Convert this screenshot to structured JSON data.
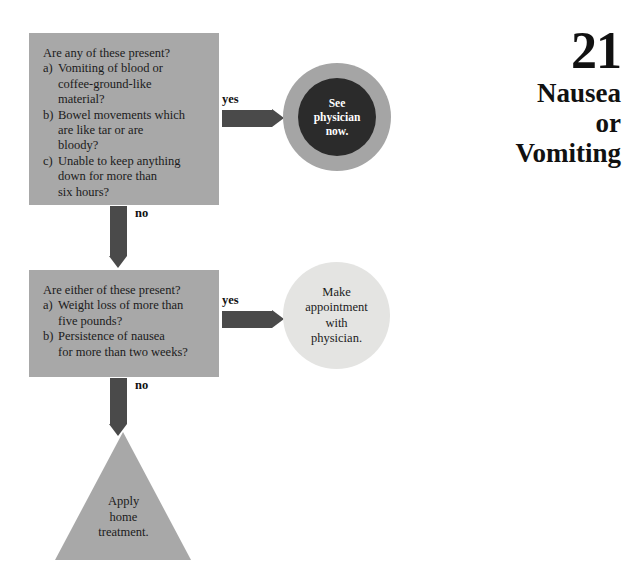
{
  "title": {
    "chapter_number": "21",
    "line1": "Nausea",
    "line2": "or",
    "line3": "Vomiting"
  },
  "colors": {
    "box_fill": "#a8a8a8",
    "arrow": "#4a4a4a",
    "urgent_ring": "#a5a5a5",
    "urgent_core": "#2b2b2b",
    "appointment_fill": "#e4e4e2",
    "triangle_fill": "#a8a8a8",
    "text": "#1b1b1b",
    "background": "#ffffff"
  },
  "flowchart": {
    "type": "decision-tree",
    "decision1": {
      "heading": "Are any of these present?",
      "items": [
        {
          "marker": "a)",
          "lines": [
            "Vomiting of blood or",
            "coffee-ground-like",
            "material?"
          ]
        },
        {
          "marker": "b)",
          "lines": [
            "Bowel movements which",
            "are like tar or are",
            "bloody?"
          ]
        },
        {
          "marker": "c)",
          "lines": [
            "Unable to keep anything",
            "down for more than",
            "six hours?"
          ]
        }
      ],
      "yes_label": "yes",
      "no_label": "no"
    },
    "decision2": {
      "heading": "Are either of these present?",
      "items": [
        {
          "marker": "a)",
          "lines": [
            "Weight loss of more than",
            "five pounds?"
          ]
        },
        {
          "marker": "b)",
          "lines": [
            "Persistence of nausea",
            "for more than two weeks?"
          ]
        }
      ],
      "yes_label": "yes",
      "no_label": "no"
    },
    "outcome_urgent": {
      "line1": "See",
      "line2": "physician",
      "line3": "now."
    },
    "outcome_appointment": {
      "line1": "Make",
      "line2": "appointment",
      "line3": "with",
      "line4": "physician."
    },
    "outcome_home": {
      "line1": "Apply",
      "line2": "home",
      "line3": "treatment."
    }
  }
}
